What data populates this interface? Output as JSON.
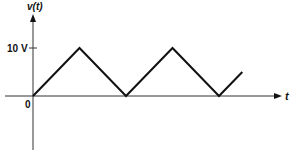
{
  "chart_data": {
    "type": "line",
    "title": "",
    "xlabel": "t",
    "ylabel": "v(t)",
    "ytick_labels": [
      "0",
      "10 V"
    ],
    "series": [
      {
        "name": "v(t)",
        "points": [
          {
            "t": 0,
            "v": 0
          },
          {
            "t": 1,
            "v": 10
          },
          {
            "t": 2,
            "v": 0
          },
          {
            "t": 3,
            "v": 10
          },
          {
            "t": 4,
            "v": 0
          },
          {
            "t": 4.5,
            "v": 5
          }
        ]
      }
    ],
    "ylim": [
      0,
      10
    ],
    "grid": false,
    "legend": "none"
  },
  "labels": {
    "y_axis": "v(t)",
    "x_axis": "t",
    "origin": "0",
    "peak": "10 V"
  },
  "colors": {
    "stroke": "#111111",
    "background": "#ffffff"
  }
}
